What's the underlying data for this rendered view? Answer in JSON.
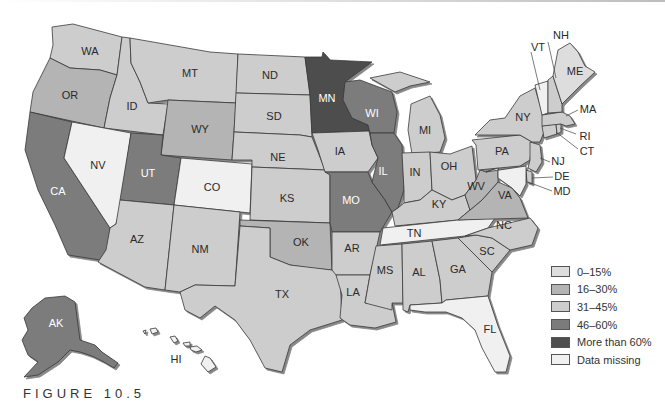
{
  "figure": {
    "caption": "FIGURE 10.5"
  },
  "legend": {
    "items": [
      {
        "label": "0–15%",
        "color": "#dddddd",
        "key": "c0"
      },
      {
        "label": "16–30%",
        "color": "#b4b4b4",
        "key": "c1"
      },
      {
        "label": "31–45%",
        "color": "#cdcdcd",
        "key": "c2"
      },
      {
        "label": "46–60%",
        "color": "#7b7b7b",
        "key": "c3"
      },
      {
        "label": "More than 60%",
        "color": "#4e4e4e",
        "key": "c4"
      },
      {
        "label": "Data missing",
        "color": "#f0f0f0",
        "key": "c5"
      }
    ]
  },
  "map": {
    "states": [
      {
        "abbr": "WA",
        "category": "31–45%"
      },
      {
        "abbr": "OR",
        "category": "16–30%"
      },
      {
        "abbr": "CA",
        "category": "46–60%"
      },
      {
        "abbr": "ID",
        "category": "31–45%"
      },
      {
        "abbr": "NV",
        "category": "Data missing"
      },
      {
        "abbr": "MT",
        "category": "31–45%"
      },
      {
        "abbr": "WY",
        "category": "16–30%"
      },
      {
        "abbr": "UT",
        "category": "46–60%"
      },
      {
        "abbr": "CO",
        "category": "Data missing"
      },
      {
        "abbr": "AZ",
        "category": "31–45%"
      },
      {
        "abbr": "NM",
        "category": "31–45%"
      },
      {
        "abbr": "ND",
        "category": "31–45%"
      },
      {
        "abbr": "SD",
        "category": "31–45%"
      },
      {
        "abbr": "NE",
        "category": "31–45%"
      },
      {
        "abbr": "KS",
        "category": "31–45%"
      },
      {
        "abbr": "OK",
        "category": "16–30%"
      },
      {
        "abbr": "TX",
        "category": "31–45%"
      },
      {
        "abbr": "MN",
        "category": "More than 60%"
      },
      {
        "abbr": "IA",
        "category": "31–45%"
      },
      {
        "abbr": "MO",
        "category": "46–60%"
      },
      {
        "abbr": "AR",
        "category": "31–45%"
      },
      {
        "abbr": "LA",
        "category": "31–45%"
      },
      {
        "abbr": "WI",
        "category": "46–60%"
      },
      {
        "abbr": "IL",
        "category": "46–60%"
      },
      {
        "abbr": "MI",
        "category": "31–45%"
      },
      {
        "abbr": "IN",
        "category": "31–45%"
      },
      {
        "abbr": "OH",
        "category": "31–45%"
      },
      {
        "abbr": "KY",
        "category": "31–45%"
      },
      {
        "abbr": "TN",
        "category": "Data missing"
      },
      {
        "abbr": "MS",
        "category": "31–45%"
      },
      {
        "abbr": "AL",
        "category": "31–45%"
      },
      {
        "abbr": "GA",
        "category": "31–45%"
      },
      {
        "abbr": "FL",
        "category": "Data missing"
      },
      {
        "abbr": "SC",
        "category": "31–45%"
      },
      {
        "abbr": "NC",
        "category": "31–45%"
      },
      {
        "abbr": "VA",
        "category": "16–30%"
      },
      {
        "abbr": "WV",
        "category": "16–30%"
      },
      {
        "abbr": "PA",
        "category": "31–45%"
      },
      {
        "abbr": "NY",
        "category": "31–45%"
      },
      {
        "abbr": "NJ",
        "category": "31–45%"
      },
      {
        "abbr": "DE",
        "category": "31–45%"
      },
      {
        "abbr": "MD",
        "category": "Data missing"
      },
      {
        "abbr": "CT",
        "category": "31–45%"
      },
      {
        "abbr": "RI",
        "category": "31–45%"
      },
      {
        "abbr": "MA",
        "category": "31–45%"
      },
      {
        "abbr": "VT",
        "category": "Data missing"
      },
      {
        "abbr": "NH",
        "category": "31–45%"
      },
      {
        "abbr": "ME",
        "category": "0–15%"
      },
      {
        "abbr": "AK",
        "category": "46–60%"
      },
      {
        "abbr": "HI",
        "category": "Data missing"
      }
    ],
    "labels": {
      "WA": "WA",
      "OR": "OR",
      "CA": "CA",
      "ID": "ID",
      "NV": "NV",
      "MT": "MT",
      "WY": "WY",
      "UT": "UT",
      "CO": "CO",
      "AZ": "AZ",
      "NM": "NM",
      "ND": "ND",
      "SD": "SD",
      "NE": "NE",
      "KS": "KS",
      "OK": "OK",
      "TX": "TX",
      "MN": "MN",
      "IA": "IA",
      "MO": "MO",
      "AR": "AR",
      "LA": "LA",
      "WI": "WI",
      "IL": "IL",
      "MI": "MI",
      "IN": "IN",
      "OH": "OH",
      "KY": "KY",
      "TN": "TN",
      "MS": "MS",
      "AL": "AL",
      "GA": "GA",
      "FL": "FL",
      "SC": "SC",
      "NC": "NC",
      "VA": "VA",
      "WV": "WV",
      "PA": "PA",
      "NY": "NY",
      "NJ": "NJ",
      "DE": "DE",
      "MD": "MD",
      "CT": "CT",
      "RI": "RI",
      "MA": "MA",
      "VT": "VT",
      "NH": "NH",
      "ME": "ME",
      "AK": "AK",
      "HI": "HI"
    }
  }
}
